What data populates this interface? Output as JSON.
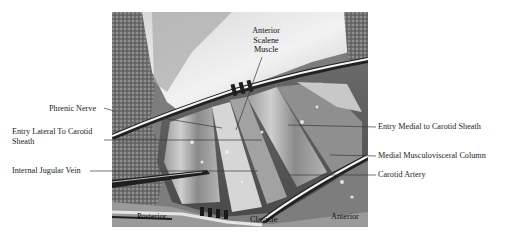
{
  "figure": {
    "photo_bounds": {
      "x": 112,
      "y": 12,
      "width": 256,
      "height": 215
    },
    "colors": {
      "text": "#1c1c1c",
      "leader_line": "#3a3a3a",
      "background": "#ffffff"
    }
  },
  "labels": {
    "anterior_scalene_muscle": {
      "lines": [
        "Anterior",
        "Scalene",
        "Muscle"
      ]
    },
    "phrenic_nerve": {
      "text": "Phrenic Nerve"
    },
    "entry_lateral": {
      "lines": [
        "Entry Lateral To Carotid",
        "Sheath"
      ]
    },
    "internal_jugular_vein": {
      "text": "Internal Jugular Vein"
    },
    "entry_medial": {
      "text": "Entry Medial to Carotid Sheath"
    },
    "medial_musculovisceral_column": {
      "text": "Medial Musculovisceral Column"
    },
    "carotid_artery": {
      "text": "Carotid Artery"
    },
    "posterior": {
      "text": "Posterior"
    },
    "clavicle": {
      "text": "Clavicle"
    },
    "anterior": {
      "text": "Anterior"
    }
  },
  "leader_lines": [
    {
      "label": "Phrenic Nerve",
      "x1": 104,
      "y1": 108,
      "x2": 112,
      "y2": 110
    },
    {
      "label": "Phrenic Nerve",
      "x1": 162,
      "y1": 118,
      "x2": 222,
      "y2": 128
    },
    {
      "label": "Entry Lateral To Carotid Sheath",
      "x1": 104,
      "y1": 140,
      "x2": 262,
      "y2": 140
    },
    {
      "label": "Internal Jugular Vein",
      "x1": 90,
      "y1": 171,
      "x2": 258,
      "y2": 171
    },
    {
      "label": "Entry Medial to Carotid Sheath",
      "x1": 288,
      "y1": 125,
      "x2": 376,
      "y2": 127
    },
    {
      "label": "Medial Musculovisceral Column",
      "x1": 330,
      "y1": 155,
      "x2": 376,
      "y2": 156
    },
    {
      "label": "Carotid Artery",
      "x1": 288,
      "y1": 175,
      "x2": 376,
      "y2": 175
    },
    {
      "label": "Anterior Scalene Muscle",
      "x1": 262,
      "y1": 57,
      "x2": 236,
      "y2": 130
    }
  ]
}
